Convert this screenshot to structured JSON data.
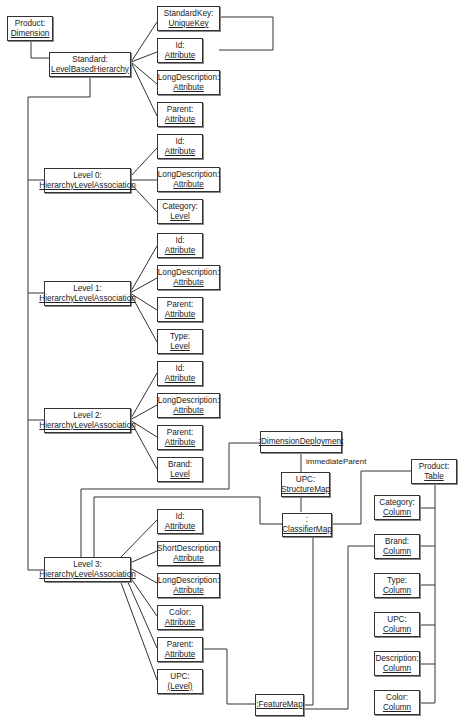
{
  "nodes": {
    "product_dim": {
      "name": "Product:",
      "type": "Dimension"
    },
    "standard": {
      "name": "Standard:",
      "type": "LevelBasedHierarchy"
    },
    "std_key": {
      "name": "StandardKey:",
      "type": "UniqueKey"
    },
    "std_id": {
      "name": "Id:",
      "type": "Attribute"
    },
    "std_longdesc": {
      "name": "LongDescription:",
      "type": "Attribute"
    },
    "std_parent": {
      "name": "Parent:",
      "type": "Attribute"
    },
    "level0": {
      "name": "Level 0:",
      "type": "HierarchyLevelAssociation"
    },
    "l0_id": {
      "name": "Id:",
      "type": "Attribute"
    },
    "l0_longdesc": {
      "name": "LongDescription:",
      "type": "Attribute"
    },
    "l0_category": {
      "name": "Category:",
      "type": "Level"
    },
    "level1": {
      "name": "Level 1:",
      "type": "HierarchyLevelAssociation"
    },
    "l1_id": {
      "name": "Id:",
      "type": "Attribute"
    },
    "l1_longdesc": {
      "name": "LongDescription:",
      "type": "Attribute"
    },
    "l1_parent": {
      "name": "Parent:",
      "type": "Attribute"
    },
    "l1_type": {
      "name": "Type:",
      "type": "Level"
    },
    "level2": {
      "name": "Level 2:",
      "type": "HierarchyLevelAssociation"
    },
    "l2_id": {
      "name": "Id:",
      "type": "Attribute"
    },
    "l2_longdesc": {
      "name": "LongDescription:",
      "type": "Attribute"
    },
    "l2_parent": {
      "name": "Parent:",
      "type": "Attribute"
    },
    "l2_brand": {
      "name": "Brand:",
      "type": "Level"
    },
    "level3": {
      "name": "Level 3:",
      "type": "HierarchyLevelAssociation"
    },
    "l3_id": {
      "name": "Id:",
      "type": "Attribute"
    },
    "l3_shortdesc": {
      "name": "ShortDescription:",
      "type": "Attribute"
    },
    "l3_longdesc": {
      "name": "LongDescription:",
      "type": "Attribute"
    },
    "l3_color": {
      "name": "Color:",
      "type": "Attribute"
    },
    "l3_parent": {
      "name": "Parent:",
      "type": "Attribute"
    },
    "l3_upc": {
      "name": "UPC:",
      "type": "(Level)"
    },
    "dim_deploy": {
      "name": "",
      "type": ":DimensionDeployment"
    },
    "upc_structmap": {
      "name": "UPC:",
      "type": "StructureMap"
    },
    "classifier": {
      "name": ":",
      "type": "ClassifierMap"
    },
    "featuremap": {
      "name": "",
      "type": ":FeatureMap"
    },
    "product_table": {
      "name": "Product:",
      "type": "Table"
    },
    "col_category": {
      "name": "Category:",
      "type": "Column"
    },
    "col_brand": {
      "name": "Brand:",
      "type": "Column"
    },
    "col_type": {
      "name": "Type:",
      "type": "Column"
    },
    "col_upc": {
      "name": "UPC:",
      "type": "Column"
    },
    "col_description": {
      "name": "Description:",
      "type": "Column"
    },
    "col_color": {
      "name": "Color:",
      "type": "Column"
    }
  },
  "labels": {
    "immediate_parent": "immediateParent"
  }
}
